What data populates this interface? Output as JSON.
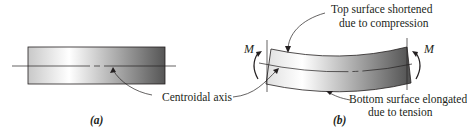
{
  "figure": {
    "panel_a": {
      "caption": "(a)",
      "labels": {
        "centroidal_axis": "Centroidal axis"
      }
    },
    "panel_b": {
      "caption": "(b)",
      "labels": {
        "top_line1": "Top surface shortened",
        "top_line2": "due to compression",
        "bottom_line1": "Bottom surface elongated",
        "bottom_line2": "due to tension",
        "moment_left": "M",
        "moment_right": "M"
      }
    },
    "colors": {
      "beam_light": "#ffffff",
      "beam_dark": "#555555",
      "line": "#231f20"
    }
  }
}
